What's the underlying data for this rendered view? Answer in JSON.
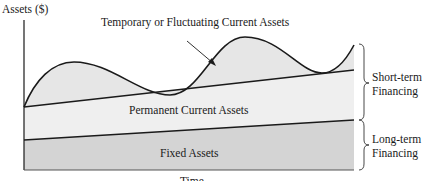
{
  "diagram": {
    "y_axis_label": "Assets ($)",
    "x_axis_label": "Time",
    "regions": {
      "temporary": "Temporary or Fluctuating Current Assets",
      "permanent": "Permanent Current Assets",
      "fixed": "Fixed Assets"
    },
    "financing": {
      "short_term_line1": "Short-term",
      "short_term_line2": "Financing",
      "long_term_line1": "Long-term",
      "long_term_line2": "Financing"
    },
    "colors": {
      "temporary_fill": "#e6e6e6",
      "permanent_fill": "#efefef",
      "fixed_fill": "#d4d4d4",
      "line": "#1a1a1a"
    }
  }
}
